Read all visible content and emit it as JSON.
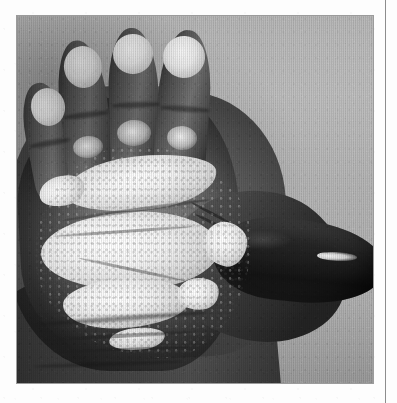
{
  "page": {
    "background_color": "#fdfdfd",
    "width": 397,
    "height": 403
  },
  "column_rule": {
    "color": "#8d8d8d",
    "orientation": "vertical",
    "position_x": 385
  },
  "figure": {
    "kind": "halftone-photograph",
    "caption": "",
    "frame": {
      "x": 17,
      "y": 16,
      "width": 356,
      "height": 367
    },
    "view": "palmar surface, left hand, thumb abducted to the right",
    "background_color": "#b6b6b6",
    "skin_tone_color": "#5e5652",
    "lesion_color": "#f7f5f0",
    "regions": [
      {
        "name": "little-finger",
        "label": "little finger"
      },
      {
        "name": "ring-finger",
        "label": "ring finger"
      },
      {
        "name": "middle-finger",
        "label": "middle finger"
      },
      {
        "name": "index-finger",
        "label": "index finger"
      },
      {
        "name": "thumb",
        "label": "thumb"
      },
      {
        "name": "palm",
        "label": "palm"
      },
      {
        "name": "thenar-eminence",
        "label": "thenar eminence"
      },
      {
        "name": "wrist",
        "label": "wrist"
      }
    ],
    "findings": [
      {
        "name": "fingertip-patch-little",
        "site": "little finger pad",
        "description": "well-defined depigmented scaly patch"
      },
      {
        "name": "fingertip-patch-ring",
        "site": "ring finger pad",
        "description": "well-defined depigmented scaly patch"
      },
      {
        "name": "fingertip-patch-middle",
        "site": "middle finger pad",
        "description": "well-defined depigmented scaly patch"
      },
      {
        "name": "fingertip-patch-index",
        "site": "index finger pad",
        "description": "well-defined depigmented scaly patch"
      },
      {
        "name": "palmar-plaque-upper",
        "site": "distal palm",
        "description": "confluent transverse hyperkeratotic band"
      },
      {
        "name": "palmar-plaque-central",
        "site": "mid palm",
        "description": "large irregular scaly plaque"
      },
      {
        "name": "palmar-plaque-lower",
        "site": "hypothenar",
        "description": "extension of scaly plaque toward the wrist"
      },
      {
        "name": "thumb-tip-highlight",
        "site": "thumb pad",
        "description": "small pale focus near the thumb tip"
      }
    ]
  }
}
